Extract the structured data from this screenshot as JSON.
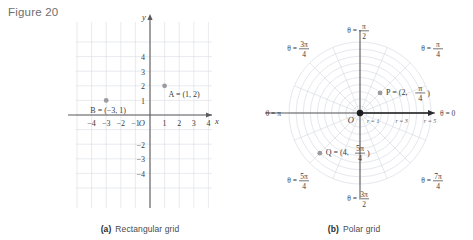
{
  "figure": {
    "label": "Figure 20"
  },
  "panel_a": {
    "caption_tag": "(a)",
    "caption_text": "Rectangular grid",
    "axis_x_label": "x",
    "axis_y_label": "y",
    "origin_label": "O",
    "x_ticks": [
      "-4",
      "-3",
      "-2",
      "-1",
      "1",
      "2",
      "3",
      "4"
    ],
    "y_ticks": [
      "4",
      "3",
      "2",
      "1",
      "-2",
      "-3",
      "-4"
    ],
    "points": [
      {
        "name": "A",
        "label": "A = (1, 2)",
        "x": 1,
        "y": 2
      },
      {
        "name": "B",
        "label": "B = (-3, 1)",
        "x": -3,
        "y": 1
      }
    ]
  },
  "panel_b": {
    "caption_tag": "(b)",
    "caption_text": "Polar grid",
    "origin_label": "O",
    "theta_labels": [
      {
        "name": "theta-0",
        "text": "θ = 0"
      },
      {
        "name": "theta-pi-4",
        "prefix": "θ =",
        "num": "π",
        "den": "4"
      },
      {
        "name": "theta-pi-2",
        "prefix": "θ =",
        "num": "π",
        "den": "2"
      },
      {
        "name": "theta-3pi-4",
        "prefix": "θ =",
        "num": "3π",
        "den": "4"
      },
      {
        "name": "theta-pi",
        "text": "θ = π"
      },
      {
        "name": "theta-5pi-4",
        "prefix": "θ =",
        "num": "5π",
        "den": "4"
      },
      {
        "name": "theta-3pi-2",
        "prefix": "θ =",
        "num": "3π",
        "den": "2"
      },
      {
        "name": "theta-7pi-4",
        "prefix": "θ =",
        "num": "7π",
        "den": "4"
      }
    ],
    "r_labels": [
      "r = 1",
      "r = 3",
      "r = 5"
    ],
    "points": [
      {
        "name": "P",
        "prefix": "P =",
        "r": "2",
        "num": "π",
        "den": "4",
        "r_val": 2,
        "theta_deg": 45
      },
      {
        "name": "Q",
        "prefix": "Q =",
        "r": "4",
        "num": "5π",
        "den": "4",
        "r_val": 4,
        "theta_deg": 225
      }
    ]
  },
  "chart_data": {
    "type": "scatter",
    "title": "Figure 20",
    "panels": [
      {
        "id": "a",
        "title": "Rectangular grid",
        "coordinate_system": "cartesian",
        "xlim": [
          -5,
          5
        ],
        "ylim": [
          -5,
          5
        ],
        "xlabel": "x",
        "ylabel": "y",
        "xticks": [
          -4,
          -3,
          -2,
          -1,
          1,
          2,
          3,
          4
        ],
        "yticks": [
          4,
          3,
          2,
          1,
          -2,
          -3,
          -4
        ],
        "grid": true,
        "points": [
          {
            "label": "A",
            "x": 1,
            "y": 2
          },
          {
            "label": "B",
            "x": -3,
            "y": 1
          }
        ]
      },
      {
        "id": "b",
        "title": "Polar grid",
        "coordinate_system": "polar",
        "rlim": [
          0,
          5
        ],
        "r_rings": [
          1,
          2,
          3,
          4,
          5
        ],
        "r_labeled": [
          1,
          3,
          5
        ],
        "theta_rays_deg": [
          0,
          22.5,
          45,
          67.5,
          90,
          112.5,
          135,
          157.5,
          180,
          202.5,
          225,
          247.5,
          270,
          292.5,
          315,
          337.5
        ],
        "theta_labeled": [
          "0",
          "π/4",
          "π/2",
          "3π/4",
          "π",
          "5π/4",
          "3π/2",
          "7π/4"
        ],
        "grid": true,
        "points": [
          {
            "label": "P",
            "r": 2,
            "theta": "π/4",
            "theta_deg": 45
          },
          {
            "label": "Q",
            "r": 4,
            "theta": "5π/4",
            "theta_deg": 225
          }
        ]
      }
    ]
  }
}
